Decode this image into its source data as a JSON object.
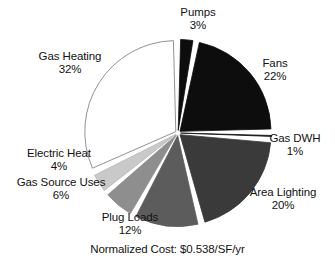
{
  "chart_data": {
    "type": "pie",
    "title": "",
    "caption": "Normalized Cost: $0.538/SF/yr",
    "legend_position": "none",
    "labels_outside": true,
    "start_angle_deg": 0,
    "direction": "clockwise",
    "categories": [
      "Pumps",
      "Fans",
      "Gas DWH",
      "Area Lighting",
      "Plug Loads",
      "Gas Source Uses",
      "Electric Heat",
      "Gas Heating"
    ],
    "values": [
      3,
      22,
      1,
      20,
      12,
      6,
      4,
      32
    ],
    "value_unit": "%",
    "slices": [
      {
        "name": "Pumps",
        "value": 3,
        "pct_label": "3%",
        "color": "#0d0d0d",
        "stroke": "#0d0d0d"
      },
      {
        "name": "Fans",
        "value": 22,
        "pct_label": "22%",
        "color": "#0d0d0d",
        "stroke": "#0d0d0d"
      },
      {
        "name": "Gas DWH",
        "value": 1,
        "pct_label": "1%",
        "color": "#141414",
        "stroke": "#141414"
      },
      {
        "name": "Area Lighting",
        "value": 20,
        "pct_label": "20%",
        "color": "#3a3a3a",
        "stroke": "#3a3a3a"
      },
      {
        "name": "Plug Loads",
        "value": 12,
        "pct_label": "12%",
        "color": "#5c5c5c",
        "stroke": "#5c5c5c"
      },
      {
        "name": "Gas Source Uses",
        "value": 6,
        "pct_label": "6%",
        "color": "#8e8e8e",
        "stroke": "#8e8e8e"
      },
      {
        "name": "Electric Heat",
        "value": 4,
        "pct_label": "4%",
        "color": "#c9c9c9",
        "stroke": "#b5b5b5"
      },
      {
        "name": "Gas Heating",
        "value": 32,
        "pct_label": "32%",
        "color": "#ffffff",
        "stroke": "#767676"
      }
    ]
  },
  "labels": {
    "pumps": {
      "name": "Pumps",
      "pct": "3%"
    },
    "fans": {
      "name": "Fans",
      "pct": "22%"
    },
    "gas_dwh": {
      "name": "Gas DWH",
      "pct": "1%"
    },
    "area_lighting": {
      "name": "Area Lighting",
      "pct": "20%"
    },
    "plug_loads": {
      "name": "Plug Loads",
      "pct": "12%"
    },
    "gas_source": {
      "name": "Gas Source Uses",
      "pct": "6%"
    },
    "electric_heat": {
      "name": "Electric Heat",
      "pct": "4%"
    },
    "gas_heating": {
      "name": "Gas Heating",
      "pct": "32%"
    }
  },
  "caption": {
    "text": "Normalized Cost: $0.538/SF/yr"
  }
}
